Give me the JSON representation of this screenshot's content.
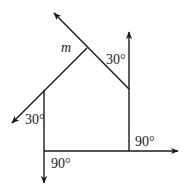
{
  "diagram": {
    "type": "geometry-angles",
    "stroke_color": "#1a1a1a",
    "background": "#ffffff",
    "labels": {
      "line_m": "m",
      "angle_top_right": "30°",
      "angle_left": "30°",
      "angle_bottom_left": "90°",
      "angle_bottom_right": "90°"
    },
    "points": {
      "apex": [
        87,
        48
      ],
      "upper_left_arrow_tip": [
        54,
        13
      ],
      "right_join": [
        129,
        89
      ],
      "right_arrow_tip": [
        129,
        32
      ],
      "left_join": [
        44,
        90
      ],
      "lower_left_arrow_tip": [
        12,
        123
      ],
      "bottom_left_corner": [
        44,
        151
      ],
      "bottom_right_corner": [
        129,
        151
      ],
      "right_horizontal_arrow_tip": [
        178,
        151
      ],
      "down_arrow_tip": [
        44,
        183
      ]
    }
  }
}
